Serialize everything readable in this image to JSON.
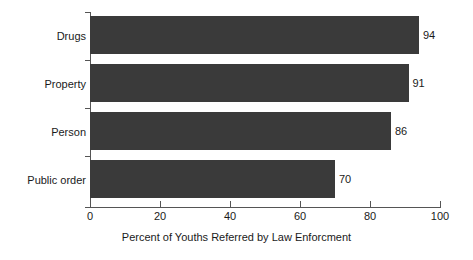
{
  "chart_data": {
    "type": "bar",
    "orientation": "horizontal",
    "title": "",
    "xlabel": "Percent of Youths Referred by Law Enforcment",
    "ylabel": "",
    "categories": [
      "Drugs",
      "Property",
      "Person",
      "Public order"
    ],
    "values": [
      94,
      91,
      86,
      70
    ],
    "value_labels": [
      "94",
      "91",
      "86",
      "70"
    ],
    "xlim": [
      0,
      100
    ],
    "xticks": [
      0,
      20,
      40,
      60,
      80,
      100
    ],
    "xtick_labels": [
      "0",
      "20",
      "40",
      "60",
      "80",
      "100"
    ],
    "grid": false,
    "legend": null,
    "bar_color": "#3a3a3a",
    "axis_color": "#555555",
    "text_color": "#1a1a1a",
    "background": "#ffffff"
  }
}
